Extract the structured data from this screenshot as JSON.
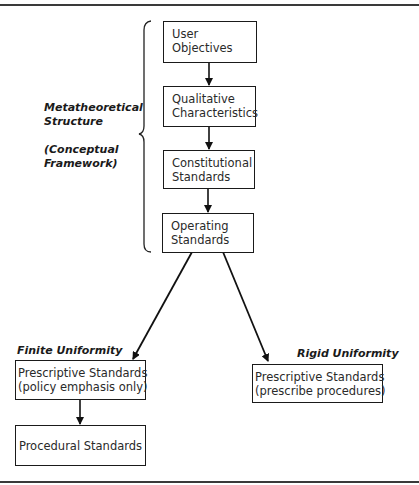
{
  "diagram": {
    "side_labels": {
      "metatheoretical": [
        "Metatheoretical",
        "Structure"
      ],
      "conceptual": [
        "(Conceptual",
        "Framework)"
      ]
    },
    "nodes": {
      "user_objectives": [
        "User",
        "Objectives"
      ],
      "qualitative_characteristics": [
        "Qualitative",
        "Characteristics"
      ],
      "constitutional_standards": [
        "Constitutional",
        "Standards"
      ],
      "operating_standards": [
        "Operating",
        "Standards"
      ],
      "prescriptive_finite": [
        "Prescriptive Standards",
        "(policy emphasis only)"
      ],
      "procedural_standards": "Procedural Standards",
      "prescriptive_rigid": [
        "Prescriptive Standards",
        "(prescribe procedures)"
      ]
    },
    "branch_labels": {
      "finite": "Finite Uniformity",
      "rigid": "Rigid Uniformity"
    },
    "edges": [
      [
        "user_objectives",
        "qualitative_characteristics"
      ],
      [
        "qualitative_characteristics",
        "constitutional_standards"
      ],
      [
        "constitutional_standards",
        "operating_standards"
      ],
      [
        "operating_standards",
        "prescriptive_finite"
      ],
      [
        "operating_standards",
        "prescriptive_rigid"
      ],
      [
        "prescriptive_finite",
        "procedural_standards"
      ]
    ]
  }
}
